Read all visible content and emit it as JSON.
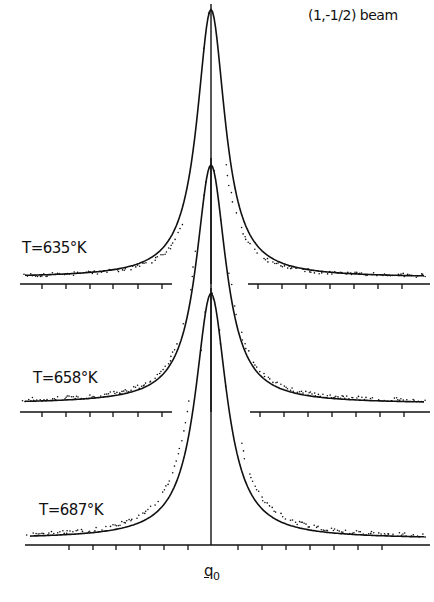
{
  "chart_data": {
    "type": "line",
    "title": "(1,-1/2) beam",
    "xlabel": "q0",
    "ylabel": "",
    "grid": false,
    "legend": null,
    "x": [
      -10,
      -8,
      -6,
      -5,
      -4,
      -3,
      -2,
      -1.5,
      -1,
      -0.5,
      0,
      0.5,
      1,
      1.5,
      2,
      3,
      4,
      5,
      6,
      8,
      10
    ],
    "series": [
      {
        "name": "T=635°K",
        "label": "T=635°K",
        "fit": [
          0.02,
          0.03,
          0.05,
          0.07,
          0.1,
          0.16,
          0.28,
          0.39,
          0.55,
          0.8,
          1.0,
          0.8,
          0.55,
          0.39,
          0.28,
          0.16,
          0.1,
          0.07,
          0.05,
          0.03,
          0.02
        ],
        "data": [
          0.02,
          0.02,
          0.03,
          0.04,
          0.06,
          0.1,
          0.22,
          0.36,
          0.55,
          0.82,
          1.0,
          0.82,
          0.56,
          0.37,
          0.22,
          0.1,
          0.05,
          0.04,
          0.03,
          0.03,
          0.03
        ]
      },
      {
        "name": "T=658°K",
        "label": "T=658°K",
        "fit": [
          0.03,
          0.04,
          0.06,
          0.08,
          0.12,
          0.18,
          0.3,
          0.42,
          0.58,
          0.82,
          1.0,
          0.82,
          0.58,
          0.42,
          0.3,
          0.18,
          0.12,
          0.08,
          0.06,
          0.04,
          0.03
        ],
        "data": [
          0.05,
          0.05,
          0.06,
          0.08,
          0.11,
          0.19,
          0.33,
          0.45,
          0.6,
          0.83,
          1.0,
          0.83,
          0.61,
          0.45,
          0.33,
          0.19,
          0.13,
          0.1,
          0.08,
          0.07,
          0.07
        ]
      },
      {
        "name": "T=687°K",
        "label": "T=687°K",
        "fit": [
          0.01,
          0.02,
          0.04,
          0.06,
          0.09,
          0.14,
          0.25,
          0.36,
          0.52,
          0.78,
          1.0,
          0.78,
          0.52,
          0.36,
          0.25,
          0.14,
          0.09,
          0.06,
          0.04,
          0.02,
          0.01
        ],
        "data": [
          0.02,
          0.04,
          0.07,
          0.1,
          0.14,
          0.2,
          0.32,
          0.43,
          0.58,
          0.82,
          1.0,
          0.82,
          0.58,
          0.43,
          0.32,
          0.21,
          0.15,
          0.11,
          0.08,
          0.06,
          0.05
        ]
      }
    ],
    "x_ticks_labeled": [
      "q0"
    ],
    "annotations": [
      "(1,-1/2) beam",
      "T=635°K",
      "T=658°K",
      "T=687°K",
      "q0"
    ]
  },
  "labels": {
    "beam": "(1,-1/2) beam",
    "t1": "T=635°K",
    "t2": "T=658°K",
    "t3": "T=687°K",
    "q0_main": "q",
    "q0_sub": "0"
  },
  "colors": {
    "ink": "#111111",
    "background": "#ffffff"
  }
}
